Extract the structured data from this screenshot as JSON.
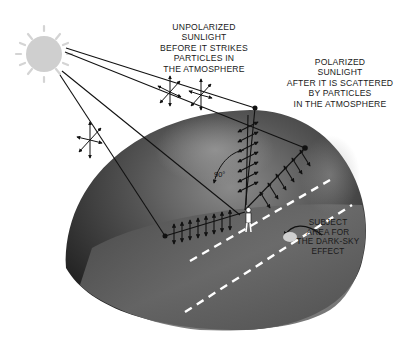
{
  "diagram": {
    "labels": {
      "unpolarized": [
        "UNPOLARIZED",
        "SUNLIGHT",
        "BEFORE IT STRIKES",
        "PARTICLES IN",
        "THE ATMOSPHERE"
      ],
      "polarized": [
        "POLARIZED",
        "SUNLIGHT",
        "AFTER IT IS SCATTERED",
        "BY PARTICLES",
        "IN THE ATMOSPHERE"
      ],
      "subject_area": [
        "SUBJECT",
        "AREA FOR",
        "THE DARK-SKY",
        "EFFECT"
      ],
      "angle": "90°"
    },
    "colors": {
      "sun": "#cfcfcf",
      "dome_dark": "#2a2a2a",
      "dome_mid": "#6a6a6a",
      "ground": "#707070",
      "lines": "#111111",
      "dashes": "#ffffff"
    }
  }
}
